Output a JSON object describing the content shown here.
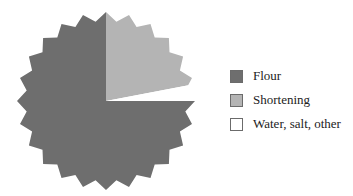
{
  "chart_data": {
    "type": "pie",
    "title": "",
    "shape": "starburst",
    "slices": [
      {
        "label": "Flour",
        "value": 75,
        "color": "#6e6e6e"
      },
      {
        "label": "Shortening",
        "value": 22,
        "color": "#b4b4b4"
      },
      {
        "label": "Water, salt, other",
        "value": 3,
        "color": "#ffffff"
      }
    ],
    "start_angle_deg": 0,
    "direction": "clockwise",
    "legend_position": "right"
  },
  "legend": {
    "items": [
      {
        "label": "Flour",
        "color": "#6e6e6e"
      },
      {
        "label": "Shortening",
        "color": "#b4b4b4"
      },
      {
        "label": "Water, salt, other",
        "color": "#ffffff"
      }
    ]
  }
}
